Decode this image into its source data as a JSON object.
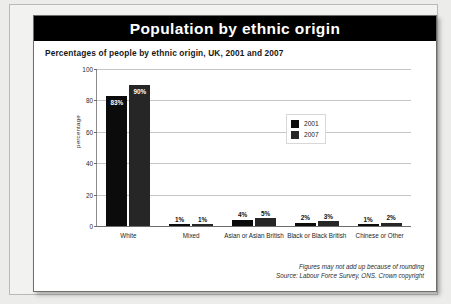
{
  "header": {
    "title": "Population by ethnic origin"
  },
  "subtitle": "Percentages of people by ethnic origin, UK, 2001 and 2007",
  "footnote": {
    "line1": "Figures may not add up because of rounding",
    "line2": "Source: Labour Force Survey, ONS. Crown copyright"
  },
  "colors": {
    "series_2001": "#0b0b0b",
    "series_2007": "#262626",
    "title_bar": "#000000",
    "card": "#ffffff",
    "gridline": "#c6c6c4",
    "page_background": "#ececeb"
  },
  "chart_data": {
    "type": "bar",
    "title": "Population by ethnic origin",
    "subtitle": "Percentages of people by ethnic origin, UK, 2001 and 2007",
    "xlabel": "",
    "ylabel": "percentage",
    "ylim": [
      0,
      100
    ],
    "yticks": [
      0,
      20,
      40,
      60,
      80,
      100
    ],
    "ytick_labels": [
      "0",
      "20",
      "40",
      "60",
      "80",
      "100"
    ],
    "grid": true,
    "legend_position": "upper-right-inside",
    "categories": [
      "White",
      "Mixed",
      "Asian or Asian British",
      "Black or Black British",
      "Chinese or Other"
    ],
    "series": [
      {
        "name": "2001",
        "color": "#0b0b0b",
        "values": [
          83,
          1,
          4,
          2,
          1
        ],
        "value_labels": [
          "83%",
          "1%",
          "4%",
          "2%",
          "1%"
        ]
      },
      {
        "name": "2007",
        "color": "#262626",
        "values": [
          90,
          1,
          5,
          3,
          2
        ],
        "value_labels": [
          "90%",
          "1%",
          "5%",
          "3%",
          "2%"
        ]
      }
    ]
  }
}
